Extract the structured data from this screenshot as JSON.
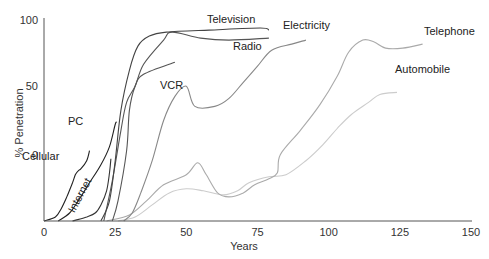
{
  "chart_data": {
    "type": "line",
    "title": "",
    "xlabel": "Years",
    "ylabel": "% Penetration",
    "xlim": [
      0,
      150
    ],
    "ylim": [
      0,
      100
    ],
    "grid": false,
    "legend": "inline labels",
    "x_ticks": [
      "0",
      "25",
      "50",
      "75",
      "100",
      "125",
      "150"
    ],
    "y_ticks": [
      {
        "label": "100",
        "y_px": 20
      },
      {
        "label": "50",
        "y_px": 86
      },
      {
        "label": "0",
        "y_px": 155
      }
    ],
    "series": [
      {
        "name": "Cellular",
        "color": "#222222",
        "points": [
          [
            0,
            0
          ],
          [
            4,
            2
          ],
          [
            6,
            6
          ],
          [
            8,
            12
          ],
          [
            10,
            19
          ],
          [
            11,
            23
          ],
          [
            12,
            25
          ],
          [
            13,
            26
          ],
          [
            15,
            30
          ],
          [
            16,
            35
          ]
        ],
        "label_pos": [
          22,
          160
        ]
      },
      {
        "name": "PC",
        "color": "#222222",
        "points": [
          [
            5,
            0
          ],
          [
            9,
            4
          ],
          [
            12,
            10
          ],
          [
            16,
            19
          ],
          [
            20,
            28
          ],
          [
            23,
            37
          ],
          [
            25,
            48
          ],
          [
            25.5,
            49
          ]
        ],
        "label_pos": [
          68,
          125
        ]
      },
      {
        "name": "Internet",
        "color": "#333333",
        "points": [
          [
            10,
            0
          ],
          [
            15,
            2
          ],
          [
            18,
            4
          ],
          [
            20,
            8
          ],
          [
            22,
            15
          ],
          [
            23,
            24
          ],
          [
            23.5,
            31
          ]
        ],
        "label_pos": [
          83,
          197
        ],
        "label_rotation": -62
      },
      {
        "name": "Television",
        "color": "#444444",
        "points": [
          [
            20,
            0
          ],
          [
            23,
            10
          ],
          [
            25,
            30
          ],
          [
            27,
            55
          ],
          [
            30,
            75
          ],
          [
            33,
            87
          ],
          [
            37,
            92
          ],
          [
            43,
            94
          ],
          [
            58,
            95
          ],
          [
            76,
            96
          ],
          [
            79,
            95
          ]
        ],
        "label_pos": [
          207,
          23
        ]
      },
      {
        "name": "Radio",
        "color": "#555555",
        "points": [
          [
            21,
            0
          ],
          [
            24,
            20
          ],
          [
            27,
            45
          ],
          [
            29,
            59
          ],
          [
            32,
            67
          ],
          [
            35,
            78
          ],
          [
            42,
            90
          ],
          [
            45,
            94
          ],
          [
            55,
            91
          ],
          [
            65,
            90
          ],
          [
            79,
            91
          ]
        ],
        "label_pos": [
          233,
          50
        ]
      },
      {
        "name": "VCR",
        "color": "#555555",
        "points": [
          [
            24,
            0
          ],
          [
            26,
            10
          ],
          [
            29,
            35
          ],
          [
            30,
            55
          ],
          [
            32,
            67
          ],
          [
            35,
            73
          ],
          [
            46,
            79
          ]
        ],
        "label_pos": [
          160,
          89
        ]
      },
      {
        "name": "Electricity",
        "color": "#888888",
        "points": [
          [
            28,
            0
          ],
          [
            31,
            4
          ],
          [
            34,
            14
          ],
          [
            38,
            30
          ],
          [
            42,
            50
          ],
          [
            46,
            62
          ],
          [
            50,
            67
          ],
          [
            53,
            57
          ],
          [
            60,
            57
          ],
          [
            65,
            61
          ],
          [
            70,
            69
          ],
          [
            75,
            77
          ],
          [
            80,
            85
          ],
          [
            87,
            88
          ],
          [
            92,
            90
          ]
        ],
        "label_pos": [
          283,
          29
        ]
      },
      {
        "name": "Telephone",
        "color": "#aaaaaa",
        "points": [
          [
            22,
            0
          ],
          [
            30,
            3
          ],
          [
            36,
            10
          ],
          [
            42,
            18
          ],
          [
            50,
            23
          ],
          [
            54,
            29
          ],
          [
            57,
            23
          ],
          [
            61,
            14
          ],
          [
            65,
            12
          ],
          [
            70,
            14
          ],
          [
            74,
            18
          ],
          [
            79,
            21
          ],
          [
            82,
            24
          ],
          [
            83,
            33
          ],
          [
            90,
            45
          ],
          [
            97,
            58
          ],
          [
            103,
            72
          ],
          [
            107,
            84
          ],
          [
            112,
            90
          ],
          [
            116,
            89
          ],
          [
            120,
            86
          ],
          [
            126,
            86
          ],
          [
            133,
            88
          ]
        ],
        "label_pos": [
          424,
          35
        ]
      },
      {
        "name": "Automobile",
        "color": "#cccccc",
        "points": [
          [
            26,
            0
          ],
          [
            32,
            2
          ],
          [
            38,
            8
          ],
          [
            44,
            14
          ],
          [
            50,
            16
          ],
          [
            56,
            15
          ],
          [
            63,
            13
          ],
          [
            68,
            15
          ],
          [
            72,
            19
          ],
          [
            79,
            22
          ],
          [
            85,
            23
          ],
          [
            92,
            30
          ],
          [
            98,
            38
          ],
          [
            103,
            46
          ],
          [
            108,
            53
          ],
          [
            114,
            59
          ],
          [
            118,
            63
          ],
          [
            124,
            64
          ]
        ],
        "label_pos": [
          395,
          73
        ]
      }
    ]
  }
}
